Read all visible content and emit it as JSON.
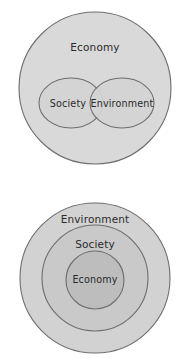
{
  "figures": [
    {
      "id": "economy-centric-model",
      "name": "Economy-centric overlapping model",
      "shapes": [
        {
          "key": "outer",
          "label": "Economy",
          "shape": "circle",
          "fill": "#d9d9d9",
          "stroke": "#6e6e6e",
          "cx": 95,
          "cy": 88,
          "r": 76,
          "label_x": 95,
          "label_y": 48
        },
        {
          "key": "society",
          "label": "Society",
          "shape": "ellipse",
          "fill": "#d4d4d4",
          "stroke": "#6e6e6e",
          "cx": 71,
          "cy": 103,
          "rx": 32,
          "ry": 25,
          "label_x": 68,
          "label_y": 104
        },
        {
          "key": "environment",
          "label": "Environment",
          "shape": "ellipse",
          "fill": "#d4d4d4",
          "stroke": "#6e6e6e",
          "cx": 122,
          "cy": 103,
          "rx": 32,
          "ry": 25,
          "label_x": 122,
          "label_y": 104
        }
      ]
    },
    {
      "id": "nested-model",
      "name": "Nested concentric model",
      "shapes": [
        {
          "key": "environment",
          "label": "Environment",
          "shape": "circle",
          "fill": "#d2d2d2",
          "stroke": "#6e6e6e",
          "cx": 95,
          "cy": 97,
          "r": 75,
          "label_x": 95,
          "label_y": 39
        },
        {
          "key": "society",
          "label": "Society",
          "shape": "circle",
          "fill": "#c9c9c9",
          "stroke": "#6e6e6e",
          "cx": 95,
          "cy": 97,
          "r": 53,
          "label_x": 95,
          "label_y": 64
        },
        {
          "key": "economy",
          "label": "Economy",
          "shape": "circle",
          "fill": "#bdbdbd",
          "stroke": "#6e6e6e",
          "cx": 95,
          "cy": 99,
          "r": 29,
          "label_x": 95,
          "label_y": 99
        }
      ]
    }
  ]
}
